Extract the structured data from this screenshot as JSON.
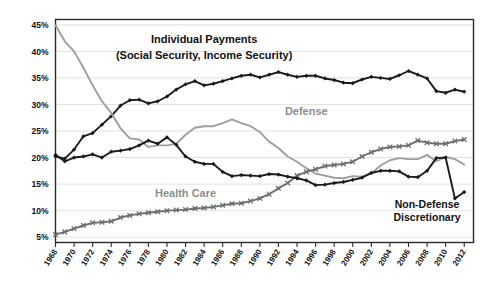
{
  "chart_data": {
    "type": "line",
    "title": "",
    "xlabel": "",
    "ylabel": "",
    "xlim": [
      1968,
      2013
    ],
    "ylim": [
      4,
      46
    ],
    "grid": true,
    "grid_axis": "y",
    "legend": "inline-annotations",
    "ytick_labels": [
      "45%",
      "40%",
      "35%",
      "30%",
      "25%",
      "20%",
      "15%",
      "10%",
      "5%"
    ],
    "ytick_values": [
      45,
      40,
      35,
      30,
      25,
      20,
      15,
      10,
      5
    ],
    "xtick_labels": [
      "1968",
      "1970",
      "1972",
      "1974",
      "1976",
      "1978",
      "1980",
      "1982",
      "1984",
      "1986",
      "1988",
      "1990",
      "1992",
      "1994",
      "1996",
      "1998",
      "2000",
      "2002",
      "2004",
      "2006",
      "2008",
      "2010",
      "2012"
    ],
    "xtick_values": [
      1968,
      1970,
      1972,
      1974,
      1976,
      1978,
      1980,
      1982,
      1984,
      1986,
      1988,
      1990,
      1992,
      1994,
      1996,
      1998,
      2000,
      2002,
      2004,
      2006,
      2008,
      2010,
      2012
    ],
    "x": [
      1968,
      1969,
      1970,
      1971,
      1972,
      1973,
      1974,
      1975,
      1976,
      1977,
      1978,
      1979,
      1980,
      1981,
      1982,
      1983,
      1984,
      1985,
      1986,
      1987,
      1988,
      1989,
      1990,
      1991,
      1992,
      1993,
      1994,
      1995,
      1996,
      1997,
      1998,
      1999,
      2000,
      2001,
      2002,
      2003,
      2004,
      2005,
      2006,
      2007,
      2008,
      2009,
      2010,
      2011,
      2012
    ],
    "annotations": [
      {
        "text": "Individual Payments",
        "x": 1984,
        "y": 41.5,
        "color": "#111111"
      },
      {
        "text": "(Social  Security, Income Security)",
        "x": 1984,
        "y": 38.5,
        "color": "#111111"
      },
      {
        "text": "Defense",
        "x": 1995,
        "y": 28.0,
        "color": "#8e8e8e"
      },
      {
        "text": "Health Care",
        "x": 1982,
        "y": 12.6,
        "color": "#9a9a9a"
      },
      {
        "text": "Non-Defense",
        "x": 2008,
        "y": 10.5,
        "color": "#111111"
      },
      {
        "text": "Discretionary",
        "x": 2008,
        "y": 8.0,
        "color": "#111111"
      }
    ],
    "series": [
      {
        "name": "Individual Payments (Social Security, Income Security)",
        "color": "#1a1a1a",
        "marker": "diamond",
        "values": [
          20.2,
          19.8,
          21.5,
          24.0,
          24.6,
          26.2,
          27.8,
          29.8,
          30.8,
          30.9,
          30.2,
          30.6,
          31.5,
          32.8,
          33.8,
          34.4,
          33.6,
          33.9,
          34.4,
          34.9,
          35.4,
          35.6,
          35.1,
          35.6,
          36.1,
          35.6,
          35.2,
          35.4,
          35.4,
          34.9,
          34.6,
          34.1,
          34.0,
          34.7,
          35.2,
          35.0,
          34.8,
          35.5,
          36.3,
          35.6,
          34.9,
          32.5,
          32.2,
          32.8,
          32.4
        ]
      },
      {
        "name": "Defense",
        "color": "#9e9e9e",
        "marker": "none",
        "values": [
          44.9,
          41.9,
          40.0,
          36.9,
          33.6,
          30.6,
          28.4,
          25.5,
          23.6,
          23.4,
          22.0,
          22.3,
          22.3,
          22.6,
          24.3,
          25.6,
          25.9,
          25.9,
          26.5,
          27.2,
          26.5,
          25.9,
          24.8,
          23.0,
          21.8,
          20.2,
          19.2,
          18.0,
          17.0,
          16.6,
          16.2,
          16.1,
          16.5,
          16.4,
          17.0,
          18.5,
          19.5,
          19.9,
          19.7,
          19.7,
          20.5,
          19.3,
          20.1,
          19.7,
          18.7
        ]
      },
      {
        "name": "Health Care",
        "color": "#6e6e6e",
        "marker": "cross",
        "values": [
          5.5,
          6.0,
          6.6,
          7.2,
          7.7,
          7.8,
          8.0,
          8.7,
          9.1,
          9.4,
          9.6,
          9.8,
          10.0,
          10.1,
          10.2,
          10.4,
          10.5,
          10.7,
          11.0,
          11.3,
          11.4,
          11.8,
          12.3,
          13.1,
          14.2,
          15.2,
          16.6,
          17.3,
          17.8,
          18.4,
          18.6,
          18.8,
          19.2,
          20.2,
          21.0,
          21.6,
          22.0,
          22.1,
          22.3,
          23.2,
          22.8,
          22.6,
          22.6,
          23.1,
          23.4
        ]
      },
      {
        "name": "Non-Defense Discretionary",
        "color": "#1a1a1a",
        "marker": "diamond",
        "values": [
          20.5,
          19.3,
          20.0,
          20.2,
          20.6,
          20.0,
          21.1,
          21.3,
          21.6,
          22.3,
          23.2,
          22.6,
          23.8,
          22.4,
          20.2,
          19.2,
          18.8,
          18.8,
          17.3,
          16.5,
          16.7,
          16.6,
          16.5,
          16.9,
          16.8,
          16.4,
          16.1,
          15.7,
          14.8,
          14.9,
          15.2,
          15.4,
          15.8,
          16.2,
          17.1,
          17.5,
          17.5,
          17.4,
          16.4,
          16.3,
          17.5,
          19.9,
          20.0,
          12.3,
          13.5
        ]
      }
    ]
  }
}
